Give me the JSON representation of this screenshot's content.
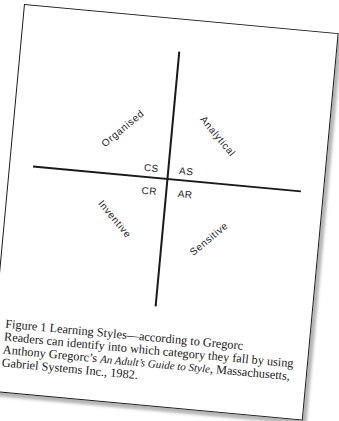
{
  "diagram": {
    "axes": [
      "vertical",
      "horizontal"
    ],
    "quadrant_codes": {
      "top_left": "CS",
      "top_right": "AS",
      "bottom_left": "CR",
      "bottom_right": "AR"
    },
    "quadrant_labels": {
      "top_left": "Organised",
      "top_right": "Analytical",
      "bottom_left": "Inventive",
      "bottom_right": "Sensitive"
    }
  },
  "caption": {
    "line1": "Figure 1  Learning Styles—according to Gregorc",
    "line2": "Readers can identify into which category they fall by using",
    "line3_pre": "Anthony Gregorc’s ",
    "line3_title": "An Adult’s Guide to Style",
    "line3_post": ", Massachusetts,",
    "line4": "Gabriel Systems Inc., 1982."
  }
}
